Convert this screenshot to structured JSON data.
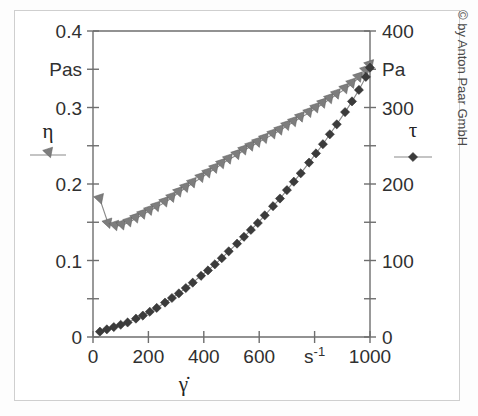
{
  "figure": {
    "copyright": "© by Anton Paar GmbH",
    "background_color": "#ffffff",
    "frame_color": "#cfcfcf"
  },
  "chart_data": {
    "type": "line",
    "title": "",
    "subtitle": "",
    "xlabel": "γ̇",
    "xunit": "s⁻¹",
    "xlim": [
      0,
      1000
    ],
    "xticks": [
      0,
      200,
      400,
      600,
      800,
      1000
    ],
    "xticklabels": [
      "0",
      "200",
      "400",
      "600",
      "s⁻¹",
      "1000"
    ],
    "grid": false,
    "legend_position": "inside-left-and-right",
    "left_axis": {
      "label": "η",
      "unit": "Pas",
      "ylim": [
        0,
        0.4
      ],
      "yticks": [
        0,
        0.1,
        0.2,
        0.3,
        0.4
      ],
      "yticklabels": [
        "0",
        "0.1",
        "0.2",
        "0.3",
        "0.4"
      ],
      "minor_ticks": [
        0.05,
        0.15,
        0.25,
        0.35
      ],
      "unit_label_at": 0.35,
      "color": "#7d7d7d"
    },
    "right_axis": {
      "label": "τ",
      "unit": "Pa",
      "ylim": [
        0,
        400
      ],
      "yticks": [
        0,
        100,
        200,
        300,
        400
      ],
      "yticklabels": [
        "0",
        "100",
        "200",
        "300",
        "400"
      ],
      "minor_ticks": [
        50,
        150,
        250,
        350
      ],
      "unit_label_at": 350,
      "color": "#3b3b3b"
    },
    "series": [
      {
        "name": "η",
        "axis": "left",
        "unit": "Pas",
        "marker": "triangle-down",
        "color": "#7d7d7d",
        "x": [
          25,
          55,
          80,
          105,
          130,
          155,
          180,
          205,
          230,
          260,
          285,
          310,
          335,
          360,
          390,
          415,
          440,
          465,
          490,
          520,
          545,
          570,
          595,
          620,
          650,
          675,
          700,
          725,
          750,
          780,
          805,
          830,
          855,
          880,
          910,
          935,
          960,
          985,
          1000
        ],
        "y": [
          0.18,
          0.148,
          0.145,
          0.146,
          0.15,
          0.155,
          0.16,
          0.165,
          0.17,
          0.176,
          0.182,
          0.189,
          0.195,
          0.201,
          0.208,
          0.214,
          0.22,
          0.226,
          0.232,
          0.238,
          0.244,
          0.249,
          0.254,
          0.259,
          0.265,
          0.27,
          0.276,
          0.281,
          0.287,
          0.293,
          0.299,
          0.305,
          0.311,
          0.317,
          0.324,
          0.331,
          0.339,
          0.348,
          0.355
        ]
      },
      {
        "name": "τ",
        "axis": "right",
        "unit": "Pa",
        "marker": "diamond",
        "color": "#3b3b3b",
        "x": [
          25,
          50,
          75,
          100,
          125,
          155,
          180,
          205,
          230,
          260,
          285,
          310,
          335,
          360,
          390,
          415,
          440,
          465,
          490,
          520,
          545,
          570,
          595,
          620,
          650,
          675,
          700,
          725,
          750,
          780,
          805,
          830,
          855,
          880,
          910,
          935,
          960,
          985,
          1000
        ],
        "y": [
          7,
          10,
          13,
          16,
          19,
          24,
          28,
          33,
          38,
          45,
          51,
          57,
          64,
          71,
          80,
          87,
          95,
          103,
          112,
          122,
          131,
          140,
          149,
          159,
          171,
          181,
          192,
          203,
          214,
          228,
          240,
          252,
          265,
          278,
          294,
          308,
          323,
          340,
          352
        ]
      }
    ],
    "legend": [
      {
        "label": "η",
        "marker": "triangle-down",
        "color": "#7d7d7d",
        "side": "left"
      },
      {
        "label": "τ",
        "marker": "diamond",
        "color": "#3b3b3b",
        "side": "right"
      }
    ]
  }
}
